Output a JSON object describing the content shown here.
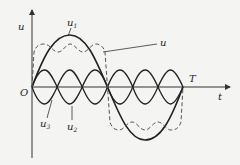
{
  "diagram": {
    "type": "waveform-decomposition",
    "axes": {
      "vertical_label": "u",
      "horizontal_label": "t",
      "origin_label": "O",
      "period_label": "T"
    },
    "curves": [
      {
        "id": "u1",
        "label": "u",
        "subscript": "1",
        "style": "solid",
        "description": "fundamental sinusoid"
      },
      {
        "id": "u2",
        "label": "u",
        "subscript": "2",
        "style": "solid",
        "description": "harmonic component"
      },
      {
        "id": "u3",
        "label": "u",
        "subscript": "3",
        "style": "solid",
        "description": "third harmonic"
      },
      {
        "id": "u",
        "label": "u",
        "subscript": "",
        "style": "dashed",
        "description": "resultant (square-like) wave"
      }
    ],
    "colors": {
      "background": "#f4f4f2",
      "ink": "#222222",
      "dashed": "#555555"
    }
  }
}
